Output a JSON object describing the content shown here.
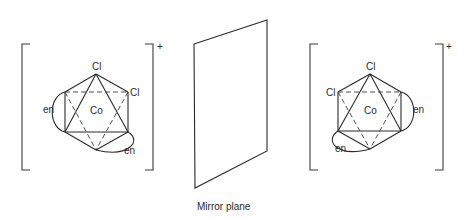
{
  "figure": {
    "caption": "Mirror plane",
    "left_complex": {
      "charge": "+",
      "center_atom": "Co",
      "ligands": {
        "cl_top": "Cl",
        "cl_second": "Cl",
        "en_left": "en",
        "en_bottom": "en"
      }
    },
    "right_complex": {
      "charge": "+",
      "center_atom": "Co",
      "ligands": {
        "cl_top": "Cl",
        "cl_second": "Cl",
        "en_right": "en",
        "en_bottom": "en"
      }
    },
    "colors": {
      "line": "#2a2a2a",
      "background": "#ffffff"
    }
  }
}
